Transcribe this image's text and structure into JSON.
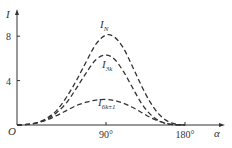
{
  "chart_data": {
    "type": "line",
    "title": "",
    "xlabel": "α",
    "ylabel": "I",
    "origin_label": "O",
    "xlim": [
      0,
      180
    ],
    "ylim": [
      0,
      10
    ],
    "x_ticks": [
      {
        "value": 90,
        "label": "90°"
      },
      {
        "value": 180,
        "label": "180°"
      }
    ],
    "y_ticks": [
      {
        "value": 4,
        "label": "4"
      },
      {
        "value": 8,
        "label": "8"
      }
    ],
    "grid": false,
    "line_style": "dashed",
    "color": "#333333",
    "x": [
      0,
      10,
      20,
      30,
      40,
      50,
      60,
      70,
      80,
      90,
      100,
      110,
      120,
      130,
      140,
      150,
      160,
      170,
      180
    ],
    "series": [
      {
        "name": "I_N",
        "label_main": "I",
        "label_sub": "N",
        "values": [
          0,
          0.05,
          0.2,
          0.6,
          1.3,
          2.5,
          4.0,
          5.7,
          7.3,
          8.1,
          7.9,
          6.9,
          5.3,
          3.6,
          2.1,
          1.0,
          0.35,
          0.08,
          0
        ]
      },
      {
        "name": "I_3k",
        "label_main": "I",
        "label_sub": "3k",
        "values": [
          0,
          0.05,
          0.2,
          0.5,
          1.1,
          2.0,
          3.3,
          4.7,
          5.9,
          6.3,
          5.9,
          4.8,
          3.4,
          2.0,
          1.0,
          0.4,
          0.1,
          0.02,
          0
        ]
      },
      {
        "name": "I_6k±1",
        "label_main": "I",
        "label_sub": "6k±1",
        "values": [
          0,
          0.05,
          0.2,
          0.45,
          0.85,
          1.3,
          1.75,
          2.05,
          2.25,
          2.3,
          2.2,
          1.95,
          1.6,
          1.15,
          0.7,
          0.35,
          0.12,
          0.02,
          0
        ]
      }
    ]
  }
}
